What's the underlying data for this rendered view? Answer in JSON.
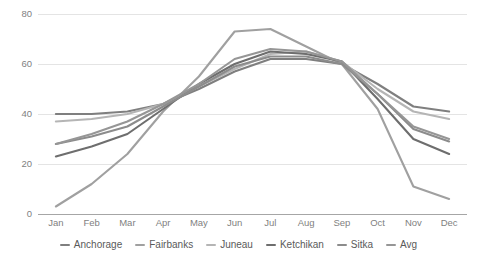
{
  "chart_data": {
    "type": "line",
    "title": "",
    "xlabel": "",
    "ylabel": "",
    "ylim": [
      0,
      80
    ],
    "yticks": [
      0,
      20,
      40,
      60,
      80
    ],
    "grid": true,
    "legend_position": "bottom",
    "categories": [
      "Jan",
      "Feb",
      "Mar",
      "Apr",
      "May",
      "Jun",
      "Jul",
      "Aug",
      "Sep",
      "Oct",
      "Nov",
      "Dec"
    ],
    "series": [
      {
        "name": "Anchorage",
        "color": "#7f7f7f",
        "values": [
          40,
          40,
          41,
          44,
          50,
          57,
          62,
          62,
          60,
          52,
          43,
          41
        ]
      },
      {
        "name": "Fairbanks",
        "color": "#a0a0a0",
        "values": [
          3,
          12,
          24,
          41,
          55,
          73,
          74,
          67,
          60,
          42,
          11,
          6
        ]
      },
      {
        "name": "Juneau",
        "color": "#b5b5b5",
        "values": [
          37,
          38,
          40,
          44,
          51,
          58,
          64,
          65,
          61,
          50,
          41,
          38
        ]
      },
      {
        "name": "Ketchikan",
        "color": "#6e6e6e",
        "values": [
          23,
          27,
          32,
          42,
          52,
          60,
          65,
          64,
          61,
          46,
          30,
          24
        ]
      },
      {
        "name": "Sitka",
        "color": "#8c8c8c",
        "values": [
          28,
          31,
          35,
          43,
          51,
          59,
          63,
          63,
          60,
          48,
          34,
          29
        ]
      },
      {
        "name": "Avg",
        "color": "#969696",
        "values": [
          28,
          32,
          37,
          44,
          52,
          62,
          66,
          65,
          61,
          48,
          35,
          30
        ]
      }
    ]
  },
  "legend": {
    "items": [
      {
        "label": "Anchorage"
      },
      {
        "label": "Fairbanks"
      },
      {
        "label": "Juneau"
      },
      {
        "label": "Ketchikan"
      },
      {
        "label": "Sitka"
      },
      {
        "label": "Avg"
      }
    ]
  }
}
